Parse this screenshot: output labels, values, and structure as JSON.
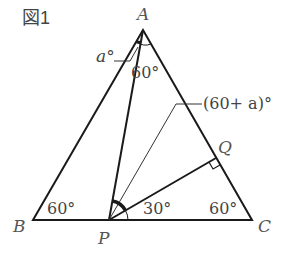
{
  "figure": {
    "title": "図1",
    "colors": {
      "line": "#1a1a1a",
      "text": "#444444",
      "bg": "#ffffff"
    }
  },
  "points": {
    "A": {
      "label": "A",
      "x": 143,
      "y": 30
    },
    "B": {
      "label": "B",
      "x": 33,
      "y": 220
    },
    "C": {
      "label": "C",
      "x": 252,
      "y": 220
    },
    "P": {
      "label": "P",
      "x": 109,
      "y": 220
    },
    "Q": {
      "label": "Q",
      "x": 216,
      "y": 158
    }
  },
  "segments": [
    "AB",
    "BC",
    "CA",
    "AP",
    "PQ",
    "P-angle-bisector-aux"
  ],
  "angles": {
    "B": "60°",
    "C": "60°",
    "A_inner": "60°",
    "a_label": "a°",
    "QPC": "30°",
    "callout": "(60+ a)°"
  },
  "marks": {
    "right_angle_at": "Q",
    "bold_arc_at": "P",
    "bold_arc_at_A": "A"
  }
}
